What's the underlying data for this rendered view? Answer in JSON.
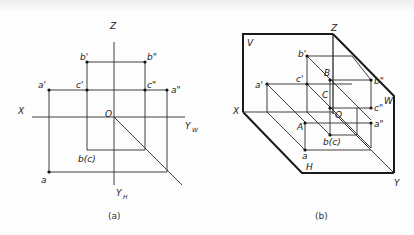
{
  "figure_a": {
    "caption": "(a)",
    "axes": {
      "z": "Z",
      "x": "X",
      "origin": "O",
      "yw": "Y",
      "yw_sub": "W",
      "yh": "Y",
      "yh_sub": "H"
    },
    "points": {
      "a_prime": "a'",
      "b_prime": "b'",
      "c_prime": "c'",
      "a_dprime": "a\"",
      "b_dprime": "b\"",
      "c_dprime": "c\"",
      "a": "a",
      "bc": "b(c)"
    }
  },
  "figure_b": {
    "caption": "(b)",
    "planes": {
      "v": "V",
      "w": "W",
      "h": "H"
    },
    "axes": {
      "z": "Z",
      "x": "X",
      "y": "Y",
      "origin": "O"
    },
    "points": {
      "a_prime": "a'",
      "b_prime": "b'",
      "c_prime": "c'",
      "a_dprime": "a\"",
      "b_dprime": "b\"",
      "c_dprime": "c\"",
      "a": "a",
      "bc": "b(c)",
      "A": "A",
      "B": "B",
      "C": "C"
    }
  }
}
